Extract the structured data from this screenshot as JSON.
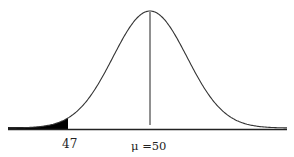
{
  "chart_data": {
    "type": "area",
    "title": "",
    "distribution": "normal",
    "mean": 50,
    "mean_label": "μ =50",
    "shaded_region": {
      "from": "-inf",
      "to": 47,
      "side": "left tail"
    },
    "x_tick_labels": [
      "47",
      "μ =50"
    ],
    "xlabel": "",
    "ylabel": "",
    "grid": false,
    "legend": null
  },
  "labels": {
    "cutoff": "47",
    "mean": "μ =50"
  },
  "colors": {
    "curve": "#333333",
    "shade": "#000000",
    "axis": "#222222",
    "background": "#ffffff"
  }
}
